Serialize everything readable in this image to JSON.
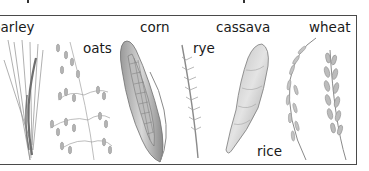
{
  "figure": {
    "type": "labeled-illustration",
    "style": "grayscale pencil drawings",
    "border_color": "#4a4a4a",
    "ink_color": "#8a8a8a"
  },
  "labels": {
    "barley": "barley",
    "oats": "oats",
    "corn": "corn",
    "rye": "rye",
    "cassava": "cassava",
    "wheat": "wheat",
    "rice": "rice"
  },
  "items": [
    {
      "name": "barley",
      "icon": "barley-ear-icon"
    },
    {
      "name": "oats",
      "icon": "oat-panicle-icon"
    },
    {
      "name": "corn",
      "icon": "corn-cob-icon"
    },
    {
      "name": "rye",
      "icon": "rye-ear-icon"
    },
    {
      "name": "cassava",
      "icon": "cassava-root-icon"
    },
    {
      "name": "rice",
      "icon": "rice-panicle-icon"
    },
    {
      "name": "wheat",
      "icon": "wheat-ear-icon"
    }
  ]
}
